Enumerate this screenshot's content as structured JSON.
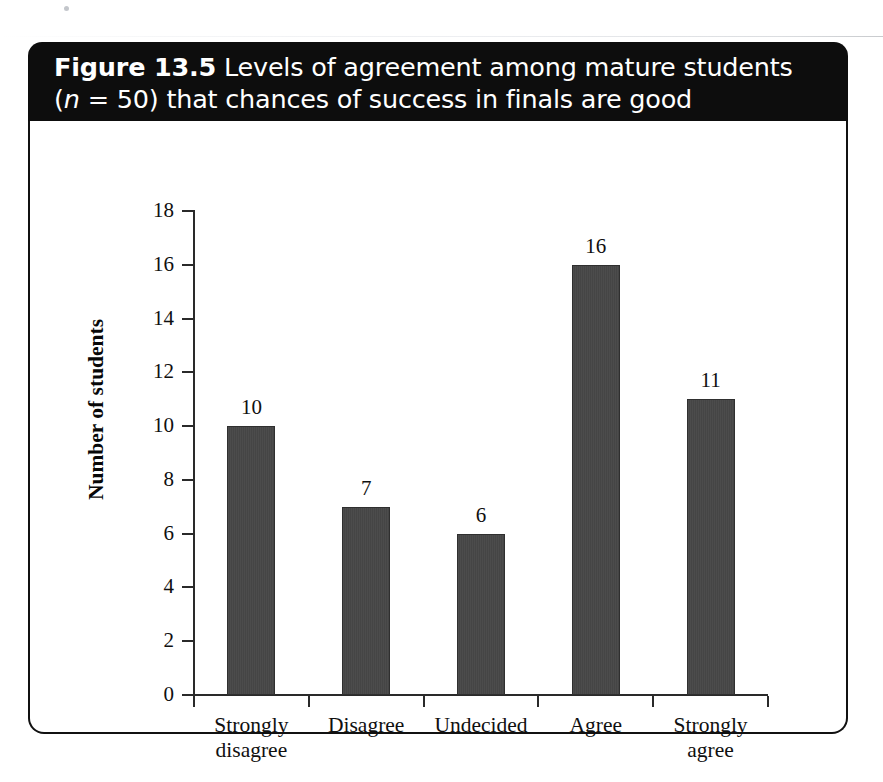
{
  "figure": {
    "caption_line1_prefix": "Figure 13.5",
    "caption_line1_rest": "Levels of agreement among mature students",
    "caption_line2_open": "(",
    "caption_line2_italic": "n",
    "caption_line2_rest": "= 50) that chances of success in finals are good"
  },
  "chart_data": {
    "type": "bar",
    "title": "Figure 13.5 Levels of agreement among mature students (n = 50) that chances of success in finals are good",
    "categories": [
      "Strongly disagree",
      "Disagree",
      "Undecided",
      "Agree",
      "Strongly agree"
    ],
    "category_lines": [
      [
        "Strongly",
        "disagree"
      ],
      [
        "Disagree",
        ""
      ],
      [
        "Undecided",
        ""
      ],
      [
        "Agree",
        ""
      ],
      [
        "Strongly",
        "agree"
      ]
    ],
    "values": [
      10,
      7,
      6,
      16,
      11
    ],
    "value_labels": [
      "10",
      "7",
      "6",
      "16",
      "11"
    ],
    "xlabel": "",
    "ylabel": "Number of students",
    "ylim": [
      0,
      18
    ],
    "ytick_labels": [
      "0",
      "2",
      "4",
      "6",
      "8",
      "10",
      "12",
      "14",
      "16",
      "18"
    ],
    "ytick_values": [
      0,
      2,
      4,
      6,
      8,
      10,
      12,
      14,
      16,
      18
    ],
    "n": 50,
    "total": 50,
    "grid": false,
    "legend": "none",
    "bar_color": "#4a4a4a",
    "bar_edge_color": "#2f2f2f",
    "axis_color": "#2a2a2a",
    "banner_color": "#0d0d0d",
    "panel_color": "#ffffff"
  }
}
